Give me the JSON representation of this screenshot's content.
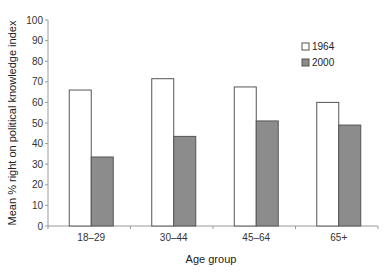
{
  "chart_data": {
    "type": "bar",
    "title": "",
    "xlabel": "Age group",
    "ylabel": "Mean % right on political knowledge index",
    "ylim": [
      0,
      100
    ],
    "yticks": [
      0,
      10,
      20,
      30,
      40,
      50,
      60,
      70,
      80,
      90,
      100
    ],
    "grid": false,
    "legend_position": "upper right",
    "categories": [
      "18–29",
      "30–44",
      "45–64",
      "65+"
    ],
    "series": [
      {
        "name": "1964",
        "color": "#ffffff",
        "values": [
          66,
          71.5,
          67.5,
          60
        ]
      },
      {
        "name": "2000",
        "color": "#8c8c8c",
        "values": [
          33.5,
          43.5,
          51,
          49
        ]
      }
    ]
  },
  "colors": {
    "axis": "#9a9a9a",
    "bar_outline": "#555555"
  }
}
